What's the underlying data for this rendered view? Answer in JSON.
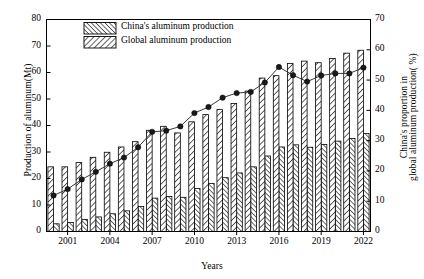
{
  "chart_data": {
    "type": "bar",
    "title": "",
    "xlabel": "Years",
    "ylabel": "Production of aluminum(Mt)",
    "ylabel_right_line1": "China's proportion in",
    "ylabel_right_line2": "global aluminum production( %)",
    "ylim": [
      0,
      80
    ],
    "ylim_right": [
      0,
      70
    ],
    "yticks": [
      0,
      10,
      20,
      30,
      40,
      50,
      60,
      70,
      80
    ],
    "yticks_right": [
      0,
      10,
      20,
      30,
      40,
      50,
      60,
      70
    ],
    "grid": false,
    "legend_position": "upper-left-inside",
    "categories": [
      2000,
      2001,
      2002,
      2003,
      2004,
      2005,
      2006,
      2007,
      2008,
      2009,
      2010,
      2011,
      2012,
      2013,
      2014,
      2015,
      2016,
      2017,
      2018,
      2019,
      2020,
      2021,
      2022
    ],
    "tick_labels": [
      "2001",
      "2004",
      "2007",
      "2010",
      "2013",
      "2016",
      "2019",
      "2022"
    ],
    "tick_label_years": [
      2001,
      2004,
      2007,
      2010,
      2013,
      2016,
      2019,
      2022
    ],
    "series": [
      {
        "name": "Global aluminum production",
        "hatch": "forward-slash",
        "unit": "Mt",
        "axis": "left",
        "values": [
          24.4,
          24.4,
          26.0,
          28.0,
          29.9,
          31.9,
          33.9,
          38.2,
          39.7,
          37.2,
          41.4,
          44.1,
          46.0,
          48.3,
          53.0,
          57.9,
          58.8,
          63.4,
          64.3,
          63.7,
          65.3,
          67.3,
          68.4
        ]
      },
      {
        "name": "China's aluminum production",
        "hatch": "back-slash",
        "unit": "Mt",
        "axis": "left",
        "values": [
          2.9,
          3.4,
          4.5,
          5.5,
          6.7,
          7.8,
          9.4,
          12.6,
          13.2,
          12.9,
          16.2,
          18.1,
          20.3,
          22.1,
          24.4,
          28.5,
          31.9,
          32.7,
          31.8,
          32.8,
          34.1,
          35.1,
          37.0
        ]
      }
    ],
    "line_series": {
      "name": "China's proportion in global aluminum production",
      "unit": "%",
      "axis": "right",
      "marker": "circle-filled",
      "values": [
        11.9,
        14.0,
        17.2,
        19.7,
        22.4,
        24.4,
        27.8,
        32.9,
        33.3,
        34.7,
        39.1,
        41.1,
        44.2,
        45.7,
        46.1,
        49.2,
        54.3,
        51.6,
        49.5,
        51.5,
        52.2,
        52.2,
        54.1
      ]
    }
  },
  "legend": {
    "items": [
      {
        "label": "China's aluminum production",
        "hatch": "back-slash"
      },
      {
        "label": "Global aluminum production",
        "hatch": "forward-slash"
      }
    ]
  },
  "colors": {
    "axis": "#000000",
    "bar_edge": "#000000",
    "bar_fill": "#ffffff",
    "hatch": "#333333",
    "line": "#3a3a3a",
    "marker": "#1a1a1a"
  }
}
